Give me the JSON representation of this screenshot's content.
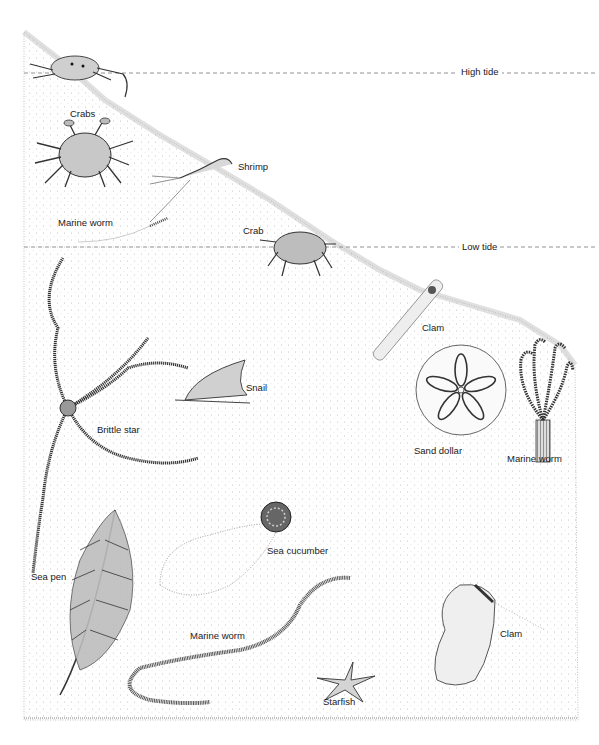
{
  "figure": {
    "colors": {
      "ink": "#1a1a1a",
      "sand_stipple": "#8a8a8a",
      "paper": "#ffffff",
      "tide_line": "#777777"
    }
  },
  "tide_lines": [
    {
      "label": "High tide",
      "y": 72
    },
    {
      "label": "Low tide",
      "y": 247
    }
  ],
  "labels": {
    "crabs": "Crabs",
    "shrimp": "Shrimp",
    "marine_worm_upper": "Marine worm",
    "crab": "Crab",
    "clam_upper": "Clam",
    "brittle_star": "Brittle star",
    "snail": "Snail",
    "sand_dollar": "Sand dollar",
    "marine_worm_tube": "Marine worm",
    "sea_cucumber": "Sea cucumber",
    "sea_pen": "Sea pen",
    "marine_worm_lower": "Marine worm",
    "starfish": "Starfish",
    "clam_lower": "Clam"
  }
}
